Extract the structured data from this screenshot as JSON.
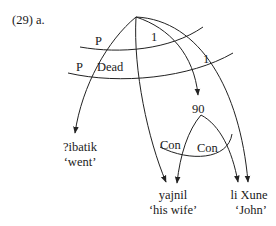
{
  "example_label": "(29) a.",
  "arcs": {
    "upper_cross_labels": [
      "P",
      "1"
    ],
    "lower_cross_labels": [
      "P",
      "Dead",
      "1"
    ],
    "bottom_cross_labels": [
      "Con",
      "Con"
    ]
  },
  "nodes": {
    "intermediate": "90",
    "verb": {
      "word": "?ibatik",
      "gloss": "‘went’"
    },
    "object": {
      "word": "yajnil",
      "gloss": "‘his wife’"
    },
    "subject": {
      "word": "li Xune",
      "gloss": "‘John’"
    }
  }
}
